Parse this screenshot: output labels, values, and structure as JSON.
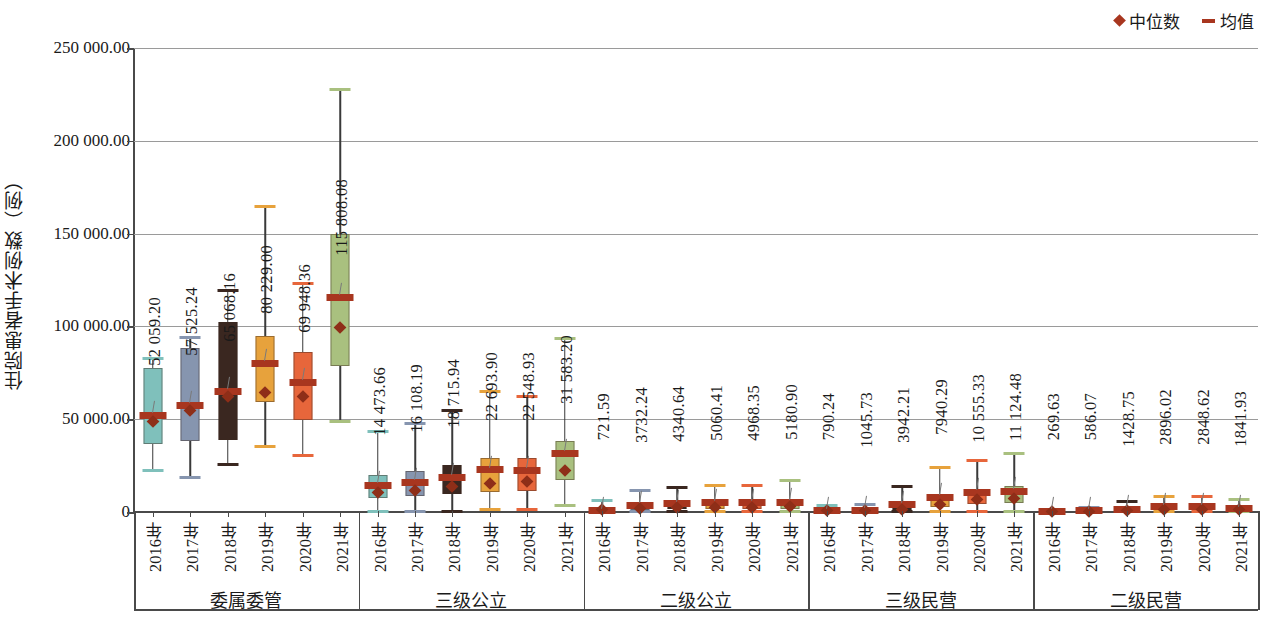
{
  "chart_data": {
    "type": "box",
    "title": "",
    "xlabel": "",
    "ylabel": "住院患者手术例数（例）",
    "ylim": [
      0,
      250000
    ],
    "yticks": [
      0,
      50000,
      100000,
      150000,
      200000,
      250000
    ],
    "ytick_labels": [
      "0",
      "50 000.00",
      "100 000.00",
      "150 000.00",
      "200 000.00",
      "250 000.00"
    ],
    "grid": true,
    "legend": {
      "position": "top-right",
      "entries": [
        {
          "label": "中位数",
          "marker": "diamond",
          "color": "#A8361F"
        },
        {
          "label": "均值",
          "marker": "dash",
          "color": "#A8361F"
        }
      ]
    },
    "series_colors": [
      "#7FC0BB",
      "#8695AF",
      "#3A2720",
      "#E7A23C",
      "#E7663B",
      "#A9C07F"
    ],
    "groups": [
      {
        "name": "委属委管",
        "categories": [
          "2016年",
          "2017年",
          "2018年",
          "2019年",
          "2020年",
          "2021年"
        ],
        "boxes": [
          {
            "year": "2016年",
            "color": "#7FC0BB",
            "whisker_low": 22500,
            "q1": 36500,
            "median": 49000,
            "mean": 52059.2,
            "q3": 77500,
            "whisker_high": 82500,
            "label": "52 059.20"
          },
          {
            "year": "2017年",
            "color": "#8695AF",
            "whisker_low": 18500,
            "q1": 38500,
            "median": 54500,
            "mean": 57525.24,
            "q3": 88500,
            "whisker_high": 94000,
            "label": "57 525.24"
          },
          {
            "year": "2018年",
            "color": "#3A2720",
            "whisker_low": 25500,
            "q1": 39000,
            "median": 62000,
            "mean": 65068.16,
            "q3": 102500,
            "whisker_high": 119500,
            "label": "65 068.16"
          },
          {
            "year": "2019年",
            "color": "#E7A23C",
            "whisker_low": 35500,
            "q1": 59000,
            "median": 64500,
            "mean": 80229.0,
            "q3": 95000,
            "whisker_high": 164500,
            "label": "80 229.00"
          },
          {
            "year": "2020年",
            "color": "#E7663B",
            "whisker_low": 30500,
            "q1": 49500,
            "median": 62000,
            "mean": 69948.36,
            "q3": 86000,
            "whisker_high": 123000,
            "label": "69 948.36"
          },
          {
            "year": "2021年",
            "color": "#A9C07F",
            "whisker_low": 48500,
            "q1": 78500,
            "median": 99500,
            "mean": 115808.08,
            "q3": 150000,
            "whisker_high": 227500,
            "label": "115 808.08"
          }
        ]
      },
      {
        "name": "三级公立",
        "categories": [
          "2016年",
          "2017年",
          "2018年",
          "2019年",
          "2020年",
          "2021年"
        ],
        "boxes": [
          {
            "year": "2016年",
            "color": "#7FC0BB",
            "whisker_low": 500,
            "q1": 7500,
            "median": 10500,
            "mean": 14473.66,
            "q3": 20000,
            "whisker_high": 43500,
            "label": "14 473.66"
          },
          {
            "year": "2017年",
            "color": "#8695AF",
            "whisker_low": 500,
            "q1": 8500,
            "median": 11500,
            "mean": 16108.19,
            "q3": 22000,
            "whisker_high": 47500,
            "label": "16 108.19"
          },
          {
            "year": "2018年",
            "color": "#3A2720",
            "whisker_low": 500,
            "q1": 9500,
            "median": 13500,
            "mean": 18715.94,
            "q3": 25500,
            "whisker_high": 54500,
            "label": "18 715.94"
          },
          {
            "year": "2019年",
            "color": "#E7A23C",
            "whisker_low": 1500,
            "q1": 11000,
            "median": 15500,
            "mean": 22693.9,
            "q3": 29000,
            "whisker_high": 65000,
            "label": "22 693.90"
          },
          {
            "year": "2020年",
            "color": "#E7663B",
            "whisker_low": 1500,
            "q1": 11500,
            "median": 16500,
            "mean": 22548.93,
            "q3": 29000,
            "whisker_high": 62500,
            "label": "22 548.93"
          },
          {
            "year": "2021年",
            "color": "#A9C07F",
            "whisker_low": 3500,
            "q1": 17500,
            "median": 22500,
            "mean": 31583.2,
            "q3": 38500,
            "whisker_high": 93500,
            "label": "31 583.20"
          }
        ]
      },
      {
        "name": "二级公立",
        "categories": [
          "2016年",
          "2017年",
          "2018年",
          "2019年",
          "2020年",
          "2021年"
        ],
        "boxes": [
          {
            "year": "2016年",
            "color": "#7FC0BB",
            "whisker_low": 100,
            "q1": 700,
            "median": 1100,
            "mean": 721.59,
            "q3": 2500,
            "whisker_high": 6000,
            "label": "721.59"
          },
          {
            "year": "2017年",
            "color": "#8695AF",
            "whisker_low": 100,
            "q1": 1200,
            "median": 2100,
            "mean": 3732.24,
            "q3": 4500,
            "whisker_high": 11500,
            "label": "3732.24"
          },
          {
            "year": "2018年",
            "color": "#3A2720",
            "whisker_low": 100,
            "q1": 1400,
            "median": 2400,
            "mean": 4340.64,
            "q3": 5000,
            "whisker_high": 13000,
            "label": "4340.64"
          },
          {
            "year": "2019年",
            "color": "#E7A23C",
            "whisker_low": 100,
            "q1": 1500,
            "median": 2600,
            "mean": 5060.41,
            "q3": 5600,
            "whisker_high": 14500,
            "label": "5060.41"
          },
          {
            "year": "2020年",
            "color": "#E7663B",
            "whisker_low": 100,
            "q1": 1500,
            "median": 2600,
            "mean": 4968.35,
            "q3": 5600,
            "whisker_high": 14500,
            "label": "4968.35"
          },
          {
            "year": "2021年",
            "color": "#A9C07F",
            "whisker_low": 100,
            "q1": 1700,
            "median": 2900,
            "mean": 5180.9,
            "q3": 6000,
            "whisker_high": 17000,
            "label": "5180.90"
          }
        ]
      },
      {
        "name": "三级民营",
        "categories": [
          "2016年",
          "2017年",
          "2018年",
          "2019年",
          "2020年",
          "2021年"
        ],
        "boxes": [
          {
            "year": "2016年",
            "color": "#7FC0BB",
            "whisker_low": 100,
            "q1": 400,
            "median": 700,
            "mean": 790.24,
            "q3": 2200,
            "whisker_high": 3500,
            "label": "790.24"
          },
          {
            "year": "2017年",
            "color": "#8695AF",
            "whisker_low": 100,
            "q1": 500,
            "median": 900,
            "mean": 1045.73,
            "q3": 2700,
            "whisker_high": 4000,
            "label": "1045.73"
          },
          {
            "year": "2018年",
            "color": "#3A2720",
            "whisker_low": 100,
            "q1": 900,
            "median": 1600,
            "mean": 3942.21,
            "q3": 4200,
            "whisker_high": 13500,
            "label": "3942.21"
          },
          {
            "year": "2019年",
            "color": "#E7A23C",
            "whisker_low": 100,
            "q1": 2600,
            "median": 4200,
            "mean": 7940.29,
            "q3": 9000,
            "whisker_high": 24000,
            "label": "7940.29"
          },
          {
            "year": "2020年",
            "color": "#E7663B",
            "whisker_low": 300,
            "q1": 4500,
            "median": 6500,
            "mean": 10555.33,
            "q3": 12500,
            "whisker_high": 27500,
            "label": "10 555.33"
          },
          {
            "year": "2021年",
            "color": "#A9C07F",
            "whisker_low": 300,
            "q1": 5000,
            "median": 7500,
            "mean": 11124.48,
            "q3": 14000,
            "whisker_high": 31500,
            "label": "11 124.48"
          }
        ]
      },
      {
        "name": "二级民营",
        "categories": [
          "2016年",
          "2017年",
          "2018年",
          "2019年",
          "2020年",
          "2021年"
        ],
        "boxes": [
          {
            "year": "2016年",
            "color": "#7FC0BB",
            "whisker_low": 50,
            "q1": 150,
            "median": 250,
            "mean": 269.63,
            "q3": 700,
            "whisker_high": 1200,
            "label": "269.63"
          },
          {
            "year": "2017年",
            "color": "#8695AF",
            "whisker_low": 50,
            "q1": 250,
            "median": 450,
            "mean": 586.07,
            "q3": 1200,
            "whisker_high": 2200,
            "label": "586.07"
          },
          {
            "year": "2018年",
            "color": "#3A2720",
            "whisker_low": 50,
            "q1": 500,
            "median": 900,
            "mean": 1428.75,
            "q3": 2300,
            "whisker_high": 5500,
            "label": "1428.75"
          },
          {
            "year": "2019年",
            "color": "#E7A23C",
            "whisker_low": 50,
            "q1": 900,
            "median": 1600,
            "mean": 2896.02,
            "q3": 3600,
            "whisker_high": 8500,
            "label": "2896.02"
          },
          {
            "year": "2020年",
            "color": "#E7663B",
            "whisker_low": 50,
            "q1": 900,
            "median": 1600,
            "mean": 2848.62,
            "q3": 3600,
            "whisker_high": 8500,
            "label": "2848.62"
          },
          {
            "year": "2021年",
            "color": "#A9C07F",
            "whisker_low": 50,
            "q1": 700,
            "median": 1200,
            "mean": 1841.93,
            "q3": 2800,
            "whisker_high": 6500,
            "label": "1841.93"
          }
        ]
      }
    ]
  }
}
